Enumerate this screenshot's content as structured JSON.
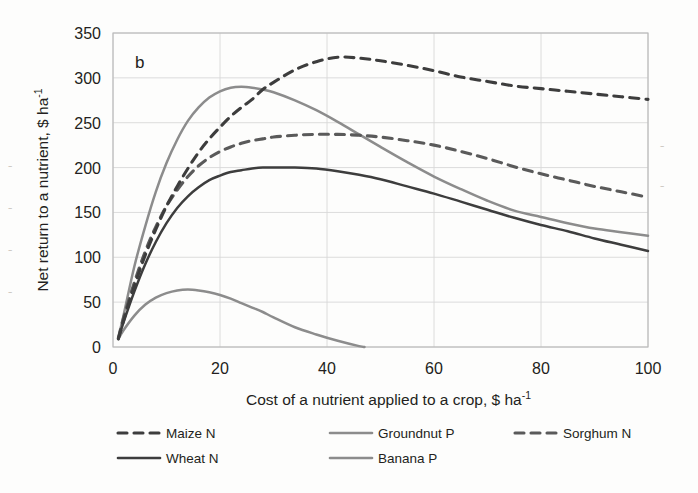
{
  "panel_label": "b",
  "axes": {
    "x_title_main": "Cost of a nutrient applied to a crop, $ ha",
    "x_title_sup": "-1",
    "y_title_main": "Net return to a nutrient, $ ha",
    "y_title_sup": "-1",
    "x_ticks": [
      "0",
      "20",
      "40",
      "60",
      "80",
      "100"
    ],
    "y_ticks": [
      "0",
      "50",
      "100",
      "150",
      "200",
      "250",
      "300",
      "350"
    ]
  },
  "colors": {
    "dark": "#3d3d3d",
    "mid": "#5a5a5a",
    "light": "#8c8c8c",
    "grid": "#d8d8d8",
    "frame": "#b9b9b9",
    "text": "#231f20"
  },
  "legend": [
    {
      "label": "Maize N",
      "style": "dashed",
      "color": "#3d3d3d"
    },
    {
      "label": "Groundnut P",
      "style": "solid",
      "color": "#8c8c8c"
    },
    {
      "label": "Sorghum N",
      "style": "dashed",
      "color": "#5a5a5a"
    },
    {
      "label": "Wheat N",
      "style": "solid",
      "color": "#3d3d3d"
    },
    {
      "label": "Banana P",
      "style": "solid",
      "color": "#8c8c8c"
    }
  ],
  "chart_data": {
    "type": "line",
    "title": "",
    "xlabel": "Cost of a nutrient applied to a crop, $ ha-1",
    "ylabel": "Net return to a nutrient, $ ha-1",
    "xlim": [
      0,
      100
    ],
    "ylim": [
      0,
      350
    ],
    "xticks": [
      0,
      20,
      40,
      60,
      80,
      100
    ],
    "yticks": [
      0,
      50,
      100,
      150,
      200,
      250,
      300,
      350
    ],
    "grid": true,
    "legend_position": "bottom",
    "panel": "b",
    "series": [
      {
        "name": "Maize N",
        "style": "dashed",
        "color": "#3d3d3d",
        "peak": {
          "x": 42,
          "y": 323
        },
        "x": [
          1,
          2,
          4,
          6,
          8,
          10,
          12,
          14,
          16,
          18,
          20,
          22,
          24,
          26,
          28,
          30,
          34,
          38,
          42,
          46,
          50,
          55,
          60,
          65,
          70,
          75,
          80,
          85,
          90,
          95,
          100
        ],
        "y": [
          9,
          30,
          68,
          102,
          131,
          157,
          179,
          199,
          217,
          232,
          245,
          257,
          267,
          276,
          287,
          295,
          309,
          318,
          323,
          322,
          319,
          314,
          308,
          301,
          296,
          291,
          288,
          285,
          282,
          279,
          276
        ]
      },
      {
        "name": "Groundnut P",
        "style": "solid",
        "color": "#8c8c8c",
        "peak": {
          "x": 24,
          "y": 290
        },
        "x": [
          1,
          2,
          4,
          6,
          8,
          10,
          12,
          14,
          16,
          18,
          20,
          22,
          24,
          26,
          28,
          30,
          34,
          38,
          42,
          46,
          50,
          55,
          60,
          65,
          70,
          75,
          80,
          85,
          90,
          95,
          100
        ],
        "y": [
          10,
          36,
          90,
          134,
          173,
          205,
          231,
          252,
          267,
          278,
          285,
          289,
          290,
          289,
          287,
          284,
          275,
          264,
          251,
          237,
          223,
          206,
          190,
          176,
          163,
          152,
          145,
          138,
          132,
          128,
          124
        ]
      },
      {
        "name": "Sorghum N",
        "style": "dashed",
        "color": "#5a5a5a",
        "peak": {
          "x": 40,
          "y": 237
        },
        "x": [
          1,
          2,
          4,
          6,
          8,
          10,
          12,
          14,
          16,
          18,
          20,
          22,
          24,
          26,
          28,
          30,
          34,
          38,
          42,
          46,
          50,
          55,
          60,
          65,
          70,
          75,
          80,
          85,
          90,
          95,
          100
        ],
        "y": [
          10,
          33,
          72,
          106,
          134,
          157,
          175,
          190,
          202,
          211,
          218,
          223,
          227,
          230,
          232,
          234,
          236,
          237,
          237,
          236,
          234,
          230,
          225,
          218,
          210,
          201,
          193,
          186,
          179,
          173,
          167
        ]
      },
      {
        "name": "Wheat N",
        "style": "solid",
        "color": "#3d3d3d",
        "peak": {
          "x": 37,
          "y": 200
        },
        "x": [
          1,
          2,
          4,
          6,
          8,
          10,
          12,
          14,
          16,
          18,
          20,
          22,
          24,
          26,
          28,
          30,
          34,
          38,
          42,
          46,
          50,
          55,
          60,
          65,
          70,
          75,
          80,
          85,
          90,
          95,
          100
        ],
        "y": [
          9,
          28,
          62,
          92,
          117,
          138,
          155,
          168,
          178,
          186,
          191,
          195,
          197,
          199,
          200,
          200,
          200,
          199,
          196,
          192,
          187,
          179,
          171,
          162,
          153,
          144,
          136,
          129,
          121,
          114,
          107
        ]
      },
      {
        "name": "Banana P",
        "style": "solid",
        "color": "#8c8c8c",
        "peak": {
          "x": 14,
          "y": 64
        },
        "zero_crossing": 47,
        "x": [
          1,
          2,
          4,
          6,
          8,
          10,
          12,
          14,
          16,
          18,
          20,
          22,
          24,
          26,
          28,
          30,
          34,
          38,
          42,
          46,
          47
        ],
        "y": [
          9,
          19,
          35,
          47,
          55,
          60,
          63,
          64,
          63,
          61,
          58,
          54,
          49,
          44,
          39,
          33,
          22,
          14,
          7,
          1,
          0
        ]
      }
    ]
  }
}
